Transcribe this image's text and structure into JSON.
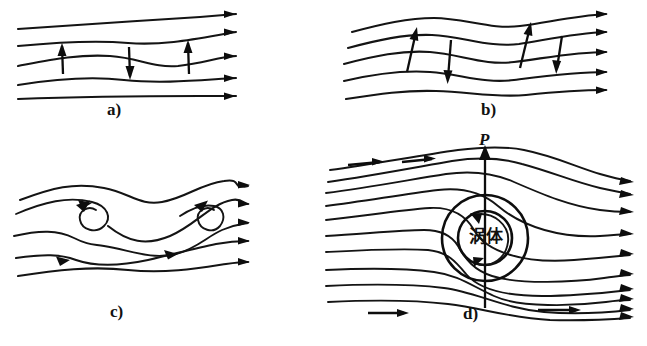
{
  "figure": {
    "background_color": "#ffffff",
    "ink_color": "#111111",
    "width": 647,
    "height": 346
  },
  "panels": [
    {
      "id": "a",
      "caption": "a)",
      "description": "Nearly straight parallel streamlines with slight undulation; three vertical velocity-perturbation arrows (up, down, up) across the central streamline.",
      "streamline_count": 5,
      "arrow_directions": [
        "up",
        "down",
        "up"
      ]
    },
    {
      "id": "b",
      "caption": "b)",
      "description": "Streamlines with amplified wave undulations; four tilted perturbation arrows alternating up and down.",
      "streamline_count": 5,
      "arrow_directions": [
        "up",
        "down",
        "up",
        "down"
      ]
    },
    {
      "id": "c",
      "caption": "c)",
      "description": "Waves roll over and break, forming two spiral vortex cores between the streamlines.",
      "streamline_count": 5,
      "vortex_count": 2
    },
    {
      "id": "d",
      "caption": "d)",
      "description": "Fully developed vortex body: flow passes around two concentric circles containing a rotating core, with a vertical lift vector P on the vertical axis.",
      "streamline_count": 10,
      "body_label": "涡体",
      "vector_label": "P",
      "rotation": "clockwise-arrow-around-core"
    }
  ],
  "labels": {
    "panel_a": "a)",
    "panel_b": "b)",
    "panel_c": "c)",
    "panel_d": "d)",
    "force_vector": "P",
    "vortex_body": "涡体"
  }
}
